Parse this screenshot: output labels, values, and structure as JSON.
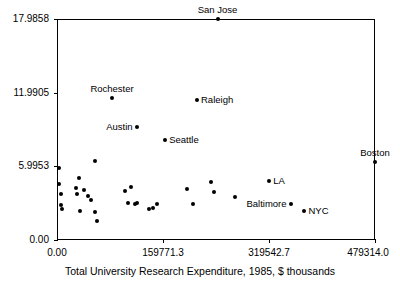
{
  "chart_data": {
    "type": "scatter",
    "title": "",
    "xlabel": "Total University Research Expenditure, 1985, $ thousands",
    "ylabel": "",
    "xlim": [
      0,
      479314.0
    ],
    "ylim": [
      0,
      17.9858
    ],
    "grid": false,
    "legend": "none",
    "xticks": [
      "0.00",
      "159771.3",
      "319542.7",
      "479314.0"
    ],
    "xtick_values": [
      0,
      159771.3,
      319542.7,
      479314.0
    ],
    "yticks": [
      "0.00",
      "5.9953",
      "11.9905",
      "17.9858"
    ],
    "ytick_values": [
      0,
      5.9953,
      11.9905,
      17.9858
    ],
    "labeled_points": [
      {
        "label": "San Jose",
        "x": 242000,
        "y": 17.99,
        "pos": "above"
      },
      {
        "label": "Rochester",
        "x": 83000,
        "y": 11.55,
        "pos": "above"
      },
      {
        "label": "Raleigh",
        "x": 211000,
        "y": 11.42,
        "pos": "right"
      },
      {
        "label": "Austin",
        "x": 120000,
        "y": 9.22,
        "pos": "left"
      },
      {
        "label": "Seattle",
        "x": 163000,
        "y": 8.15,
        "pos": "right"
      },
      {
        "label": "Boston",
        "x": 479314,
        "y": 6.32,
        "pos": "above"
      },
      {
        "label": "LA",
        "x": 320000,
        "y": 4.82,
        "pos": "right"
      },
      {
        "label": "Baltimore",
        "x": 352000,
        "y": 2.93,
        "pos": "left"
      },
      {
        "label": "NYC",
        "x": 373000,
        "y": 2.36,
        "pos": "right"
      }
    ],
    "unlabeled_points": [
      {
        "x": 2500,
        "y": 5.86
      },
      {
        "x": 3000,
        "y": 4.52
      },
      {
        "x": 6000,
        "y": 3.78
      },
      {
        "x": 5500,
        "y": 2.86
      },
      {
        "x": 7000,
        "y": 2.55
      },
      {
        "x": 33000,
        "y": 5.05
      },
      {
        "x": 28000,
        "y": 4.2
      },
      {
        "x": 29500,
        "y": 3.72
      },
      {
        "x": 41000,
        "y": 4.05
      },
      {
        "x": 47000,
        "y": 3.55
      },
      {
        "x": 35000,
        "y": 2.38
      },
      {
        "x": 52000,
        "y": 3.25
      },
      {
        "x": 57000,
        "y": 6.4
      },
      {
        "x": 58000,
        "y": 2.3
      },
      {
        "x": 60000,
        "y": 1.58
      },
      {
        "x": 103000,
        "y": 3.95
      },
      {
        "x": 112000,
        "y": 4.28
      },
      {
        "x": 107000,
        "y": 3.05
      },
      {
        "x": 118000,
        "y": 2.96
      },
      {
        "x": 120000,
        "y": 3.05
      },
      {
        "x": 138000,
        "y": 2.56
      },
      {
        "x": 145000,
        "y": 2.62
      },
      {
        "x": 150000,
        "y": 2.9
      },
      {
        "x": 196000,
        "y": 4.15
      },
      {
        "x": 205000,
        "y": 2.92
      },
      {
        "x": 232000,
        "y": 4.72
      },
      {
        "x": 236000,
        "y": 3.92
      },
      {
        "x": 268000,
        "y": 3.48
      }
    ]
  }
}
